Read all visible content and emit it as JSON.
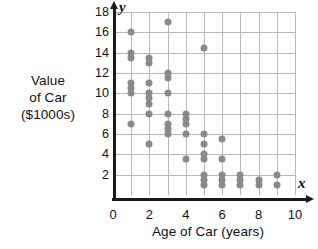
{
  "chart_data": {
    "type": "scatter",
    "title": "",
    "xlabel": "Age of Car (years)",
    "ylabel": "Value of Car ($1000s)",
    "ylabel_lines": [
      "Value",
      "of Car",
      "($1000s)"
    ],
    "x_axis_variable": "x",
    "y_axis_variable": "y",
    "xlim": [
      0,
      10
    ],
    "ylim": [
      0,
      18
    ],
    "xticks": [
      0,
      2,
      4,
      6,
      8,
      10
    ],
    "yticks": [
      2,
      4,
      6,
      8,
      10,
      12,
      14,
      16,
      18
    ],
    "grid": true,
    "grid_x_step": 1,
    "grid_y_step": 2,
    "legend": null,
    "marker_color": "#8a8a8a",
    "axis_color": "#1a1a1a",
    "grid_color": "#b9b9b9",
    "points": [
      {
        "x": 1,
        "y": 16
      },
      {
        "x": 1,
        "y": 14
      },
      {
        "x": 1,
        "y": 13.5
      },
      {
        "x": 1,
        "y": 11
      },
      {
        "x": 1,
        "y": 10.5
      },
      {
        "x": 1,
        "y": 10
      },
      {
        "x": 1,
        "y": 7
      },
      {
        "x": 2,
        "y": 13.5
      },
      {
        "x": 2,
        "y": 13
      },
      {
        "x": 2,
        "y": 11
      },
      {
        "x": 2,
        "y": 10
      },
      {
        "x": 2,
        "y": 9.5
      },
      {
        "x": 2,
        "y": 9
      },
      {
        "x": 2,
        "y": 8
      },
      {
        "x": 2,
        "y": 5
      },
      {
        "x": 3,
        "y": 17
      },
      {
        "x": 3,
        "y": 12
      },
      {
        "x": 3,
        "y": 11.5
      },
      {
        "x": 3,
        "y": 10
      },
      {
        "x": 3,
        "y": 8
      },
      {
        "x": 3,
        "y": 7
      },
      {
        "x": 3,
        "y": 6.5
      },
      {
        "x": 3,
        "y": 6
      },
      {
        "x": 4,
        "y": 8
      },
      {
        "x": 4,
        "y": 7.5
      },
      {
        "x": 4,
        "y": 7
      },
      {
        "x": 4,
        "y": 6
      },
      {
        "x": 4,
        "y": 3.5
      },
      {
        "x": 5,
        "y": 14.5
      },
      {
        "x": 5,
        "y": 6
      },
      {
        "x": 5,
        "y": 5
      },
      {
        "x": 5,
        "y": 4
      },
      {
        "x": 5,
        "y": 3.5
      },
      {
        "x": 5,
        "y": 2
      },
      {
        "x": 5,
        "y": 1.5
      },
      {
        "x": 5,
        "y": 1
      },
      {
        "x": 6,
        "y": 5.5
      },
      {
        "x": 6,
        "y": 3.5
      },
      {
        "x": 6,
        "y": 2
      },
      {
        "x": 6,
        "y": 1.5
      },
      {
        "x": 6,
        "y": 1
      },
      {
        "x": 7,
        "y": 2
      },
      {
        "x": 7,
        "y": 1.5
      },
      {
        "x": 7,
        "y": 1
      },
      {
        "x": 8,
        "y": 1.5
      },
      {
        "x": 8,
        "y": 1
      },
      {
        "x": 9,
        "y": 2
      },
      {
        "x": 9,
        "y": 1
      }
    ]
  }
}
